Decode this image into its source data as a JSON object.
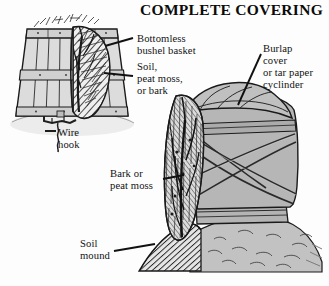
{
  "title": "COMPLETE COVERING",
  "background_color": "#fdfdfd",
  "ink_color": "#111111",
  "palette": {
    "slat_fill": "#d8d8d8",
    "burlap_fill": "#b0b0b0",
    "soil_light": "#bdbdbd",
    "mulch_hatch": "#3a3a3a",
    "outline": "#1a1a1a"
  },
  "labels": {
    "bushel_basket": "Bottomless\nbushel basket",
    "soil_peat_bark": "Soil,\npeat moss,\nor bark",
    "burlap_cover": "Burlap\ncover\nor tar paper\ncyclinder",
    "wire_hook": "Wire\nhook",
    "bark_or_peat": "Bark or\npeat moss",
    "soil_mound": "Soil\nmound"
  },
  "figures": {
    "left": {
      "name": "bushel-basket-figure",
      "description": "Bottomless bushel basket inverted over a shrub, cutaway showing mulch fill and stems, anchored by a wire hook"
    },
    "right": {
      "name": "burlap-cylinder-figure",
      "description": "Burlap or tar paper cylinder tied with criss-cross twine over a shrub, set on a soil mound, cutaway showing bark mulch"
    }
  }
}
